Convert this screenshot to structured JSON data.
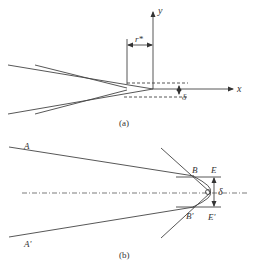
{
  "figure_a": {
    "caption": "(a)",
    "labels": {
      "y_axis": "y",
      "x_axis": "x",
      "r_star": "r*",
      "delta": "δ"
    }
  },
  "figure_b": {
    "caption": "(b)",
    "labels": {
      "A": "A",
      "A_prime": "A'",
      "B": "B",
      "B_prime": "B'",
      "E": "E",
      "E_prime": "E'",
      "delta": "δ"
    }
  },
  "colors": {
    "stroke": "#444444",
    "background": "#ffffff"
  }
}
